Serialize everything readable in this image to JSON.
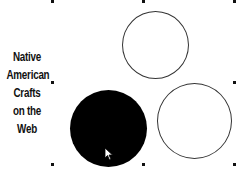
{
  "title": {
    "lines": [
      "Native",
      "American",
      "Crafts",
      "on the",
      "Web"
    ]
  },
  "shapes": [
    {
      "name": "top-circle",
      "style": "outline"
    },
    {
      "name": "left-circle",
      "style": "filled",
      "color": "#000000"
    },
    {
      "name": "right-circle",
      "style": "outline"
    }
  ],
  "colors": {
    "outline": "#333333",
    "fill": "#000000",
    "background": "#ffffff"
  },
  "icons": {
    "cursor": "arrow-pointer-icon",
    "handle": "selection-handle-icon"
  }
}
